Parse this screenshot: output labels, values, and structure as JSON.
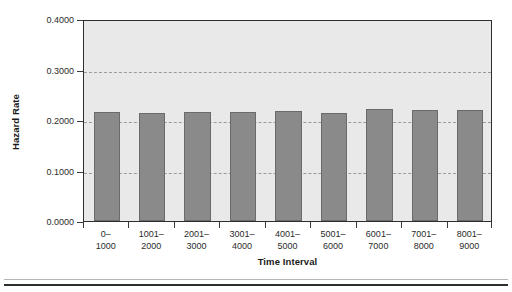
{
  "chart_data": {
    "type": "bar",
    "title": "",
    "xlabel": "Time Interval",
    "ylabel": "Hazard Rate",
    "categories": [
      "0–1000",
      "1001–2000",
      "2001–3000",
      "3001–4000",
      "4001–5000",
      "5001–6000",
      "6001–7000",
      "7001–8000",
      "8001–9000"
    ],
    "category_lines": [
      [
        "0–",
        "1000"
      ],
      [
        "1001–",
        "2000"
      ],
      [
        "2001–",
        "3000"
      ],
      [
        "3001–",
        "4000"
      ],
      [
        "4001–",
        "5000"
      ],
      [
        "5001–",
        "6000"
      ],
      [
        "6001–",
        "7000"
      ],
      [
        "7001–",
        "8000"
      ],
      [
        "8001–",
        "9000"
      ]
    ],
    "values": [
      0.2155,
      0.214,
      0.2165,
      0.215,
      0.2175,
      0.2145,
      0.2215,
      0.219,
      0.22
    ],
    "ylim": [
      0.0,
      0.4
    ],
    "yticks": [
      0.0,
      0.1,
      0.2,
      0.3,
      0.4
    ],
    "ytick_labels": [
      "0.0000",
      "0.1000",
      "0.2000",
      "0.3000",
      "0.4000"
    ],
    "grid": true,
    "gridlines_at": [
      0.1,
      0.2,
      0.3
    ],
    "legend": null,
    "legend_position": "none",
    "colors": {
      "bar_fill": "#8a8a8a",
      "bar_edge": "#6a6a6a",
      "plot_background": "#e9e9e9",
      "axis": "#2e2e2e",
      "gridline": "#9b9b9b",
      "text": "#2b2b2b",
      "page_background": "#ffffff"
    }
  }
}
